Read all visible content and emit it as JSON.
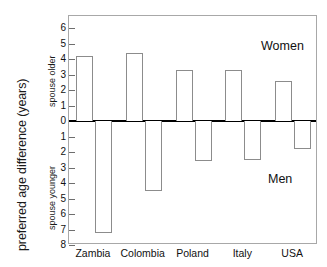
{
  "chart_data": {
    "type": "bar",
    "title": "",
    "xlabel": "",
    "ylabel": "preferred age difference (years)",
    "ylim": [
      -8,
      6.8
    ],
    "grid": false,
    "legend": "none",
    "categories": [
      "Zambia",
      "Colombia",
      "Poland",
      "Italy",
      "USA"
    ],
    "ytick_labels": [
      "6",
      "5",
      "4",
      "3",
      "2",
      "1",
      "0",
      "1",
      "2",
      "3",
      "4",
      "5",
      "6",
      "7",
      "8"
    ],
    "ytick_values": [
      6,
      5,
      4,
      3,
      2,
      1,
      0,
      -1,
      -2,
      -3,
      -4,
      -5,
      -6,
      -7,
      -8
    ],
    "series": [
      {
        "name": "Women",
        "note": "preferred spouse older",
        "values": [
          4.2,
          4.4,
          3.3,
          3.3,
          2.6
        ]
      },
      {
        "name": "Men",
        "note": "preferred spouse younger",
        "values": [
          -7.2,
          -4.5,
          -2.6,
          -2.5,
          -1.8
        ]
      }
    ],
    "annotations": [
      {
        "text": "Women",
        "x": "upper-right"
      },
      {
        "text": "Men",
        "x": "lower-right"
      }
    ],
    "axis_notes": {
      "upper": "spouse older",
      "lower": "spouse younger"
    }
  },
  "axis": {
    "ylabel_main": "preferred age difference (years)",
    "ylabel_upper": "spouse older",
    "ylabel_lower": "spouse younger"
  },
  "annotations": {
    "women": "Women",
    "men": "Men"
  },
  "colors": {
    "bar_outline": "#8c8c8c",
    "bar_fill": "#ffffff",
    "zero_line": "#000000",
    "frame": "#a8a8a8",
    "text": "#111111"
  }
}
